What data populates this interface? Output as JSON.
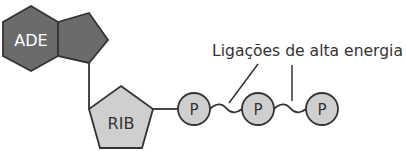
{
  "colors": {
    "adenine_fill": "#6b6b6b",
    "ribose_fill": "#cfcfcf",
    "phosphate_fill": "#cfcfcf",
    "stroke": "#333333",
    "text_dark": "#333333",
    "text_light": "#ffffff"
  },
  "adenine": {
    "label": "ADE"
  },
  "ribose": {
    "label": "RIB"
  },
  "phosphates": [
    {
      "label": "P"
    },
    {
      "label": "P"
    },
    {
      "label": "P"
    }
  ],
  "annotation": {
    "label": "Ligações de alta energia"
  }
}
